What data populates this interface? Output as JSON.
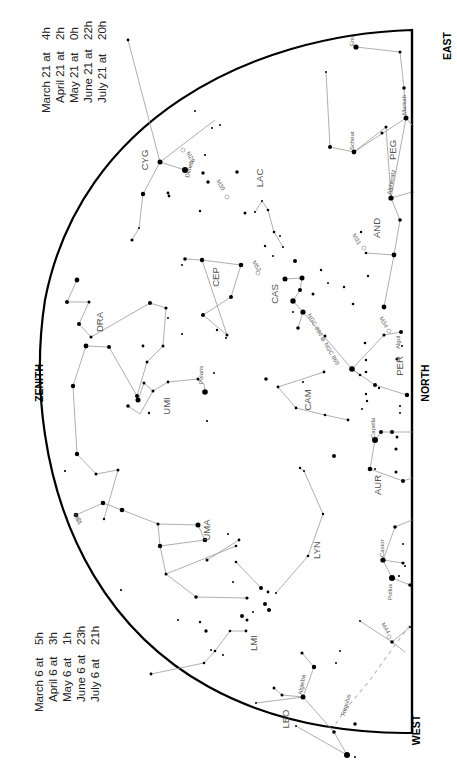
{
  "directions": {
    "zenith": "ZENITH",
    "north": "NORTH",
    "east": "EAST",
    "west": "WEST"
  },
  "time_tables": {
    "top": [
      {
        "date": "March 21 at",
        "hour": "4h"
      },
      {
        "date": "April 21 at",
        "hour": "2h"
      },
      {
        "date": "May 21 at",
        "hour": "0h"
      },
      {
        "date": "June 21 at",
        "hour": "22h"
      },
      {
        "date": "July 21 at",
        "hour": "20h"
      }
    ],
    "bottom": [
      {
        "date": "March 6 at",
        "hour": "5h"
      },
      {
        "date": "April 6 at",
        "hour": "3h"
      },
      {
        "date": "May 6 at",
        "hour": "1h"
      },
      {
        "date": "June 6 at",
        "hour": "23h"
      },
      {
        "date": "July 6 at",
        "hour": "21h"
      }
    ]
  },
  "constellations": [
    "CYG",
    "LAC",
    "PEG",
    "AND",
    "CEP",
    "CAS",
    "DRA",
    "UMI",
    "CAM",
    "PER",
    "AUR",
    "UMA",
    "LYN",
    "LMI",
    "LEO"
  ],
  "named_stars": [
    "Deneb",
    "Scheat",
    "Markab",
    "Alpheratz",
    "Polaris",
    "Algol",
    "Capella",
    "Castor",
    "Pollux",
    "Algieba",
    "Regulus",
    "Enif"
  ],
  "deep_sky_objects": [
    "M29",
    "M39",
    "M52",
    "M31",
    "M34",
    "NGC 884 ⊕ NGC 869",
    "M81",
    "M44"
  ]
}
